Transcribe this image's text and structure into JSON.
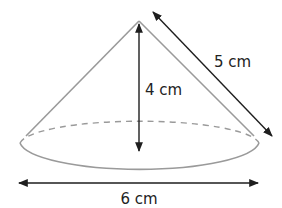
{
  "diagram": {
    "type": "cone",
    "labels": {
      "height": "4 cm",
      "slant_height": "5 cm",
      "diameter": "6 cm"
    },
    "colors": {
      "outline": "#9a9a9a",
      "arrow": "#1e1e1e",
      "text": "#222222",
      "background": "#ffffff"
    }
  }
}
